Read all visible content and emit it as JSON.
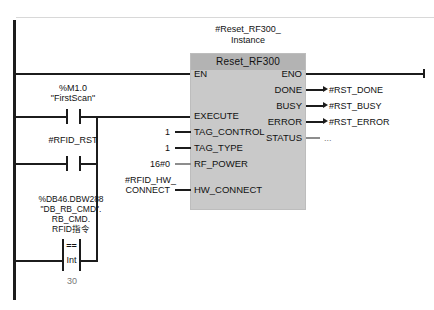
{
  "network": {
    "block": {
      "instance_name": "#Reset_RF300_\nInstance",
      "instance_line1": "#Reset_RF300_",
      "instance_line2": "Instance",
      "type_name": "Reset_RF300",
      "inputs": [
        {
          "pin": "EN",
          "operand": ""
        },
        {
          "pin": "EXECUTE",
          "operand": ""
        },
        {
          "pin": "TAG_CONTROL",
          "operand": "1"
        },
        {
          "pin": "TAG_TYPE",
          "operand": "1"
        },
        {
          "pin": "RF_POWER",
          "operand": "16#0"
        },
        {
          "pin": "HW_CONNECT",
          "operand": "#RFID_HW_\nCONNECT",
          "operand_line1": "#RFID_HW_",
          "operand_line2": "CONNECT"
        }
      ],
      "outputs": [
        {
          "pin": "ENO",
          "operand": ""
        },
        {
          "pin": "DONE",
          "operand": "#RST_DONE"
        },
        {
          "pin": "BUSY",
          "operand": "#RST_BUSY"
        },
        {
          "pin": "ERROR",
          "operand": "#RST_ERROR"
        },
        {
          "pin": "STATUS",
          "operand": "..."
        }
      ]
    },
    "contacts": [
      {
        "name": "firstscan",
        "address": "%M1.0",
        "symbol": "\"FirstScan\"",
        "type": "normally-open"
      },
      {
        "name": "rfid-rst",
        "address": "#RFID_RST",
        "symbol": "",
        "type": "normally-open"
      }
    ],
    "comparator": {
      "operator": "==",
      "data_type": "Int",
      "operand_line1": "%DB46.DBW288",
      "operand_line2": "\"DB_RB_CMD\".",
      "operand_line3": "RB_CMD.",
      "operand_line4": "RFID指令",
      "compare_value": "30"
    }
  },
  "colors": {
    "wire": "#1c1c1c",
    "block_body": "#c9c9c9",
    "block_header": "#b3b3b3",
    "text": "#111111",
    "dim_text": "#777777",
    "background": "#ffffff"
  }
}
